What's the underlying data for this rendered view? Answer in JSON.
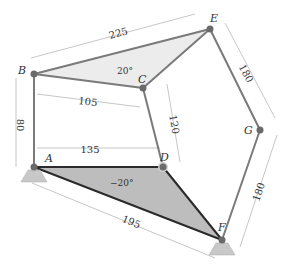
{
  "diagram": {
    "type": "linkage-mechanism",
    "joints": {
      "A": {
        "label": "A",
        "x": 34,
        "y": 167,
        "ground": true
      },
      "B": {
        "label": "B",
        "x": 34,
        "y": 74
      },
      "C": {
        "label": "C",
        "x": 143,
        "y": 88
      },
      "D": {
        "label": "D",
        "x": 163,
        "y": 167
      },
      "E": {
        "label": "E",
        "x": 210,
        "y": 29
      },
      "F": {
        "label": "F",
        "x": 222,
        "y": 240,
        "ground": true
      },
      "G": {
        "label": "G",
        "x": 260,
        "y": 130
      }
    },
    "dimensions": {
      "BE": "225",
      "AB": "80",
      "BC_horizontal": "105",
      "AD": "135",
      "CD_vertical": "120",
      "EG": "180",
      "GF": "180",
      "AF": "195"
    },
    "angles": {
      "top_triangle": "20°",
      "bottom_triangle": "−20°"
    },
    "colors": {
      "link": "#7a7a7a",
      "ground_link": "#2a2a2a",
      "shade_top": "#ececec",
      "shade_bottom": "#bdbdbd",
      "support": "#c8c8c8",
      "dimension": "#b0b0b0"
    }
  }
}
